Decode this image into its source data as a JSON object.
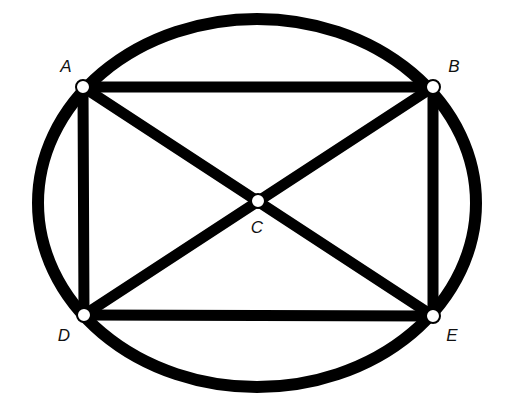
{
  "diagram": {
    "type": "geometry",
    "colors": {
      "stroke": "#000000",
      "node_fill": "#ffffff",
      "background": "#ffffff",
      "label": "#111111"
    },
    "ellipse": {
      "cx": 257,
      "cy": 203,
      "rx": 219,
      "ry": 184,
      "stroke_width": 12
    },
    "nodes": [
      {
        "id": "A",
        "label": "A",
        "x": 83,
        "y": 87,
        "label_x": 66,
        "label_y": 66
      },
      {
        "id": "B",
        "label": "B",
        "x": 433,
        "y": 87,
        "label_x": 454,
        "label_y": 66
      },
      {
        "id": "C",
        "label": "C",
        "x": 258,
        "y": 201,
        "label_x": 257,
        "label_y": 227
      },
      {
        "id": "D",
        "label": "D",
        "x": 84,
        "y": 315,
        "label_x": 64,
        "label_y": 335
      },
      {
        "id": "E",
        "label": "E",
        "x": 433,
        "y": 316,
        "label_x": 452,
        "label_y": 335
      }
    ],
    "edges": [
      {
        "from": "A",
        "to": "B"
      },
      {
        "from": "B",
        "to": "E"
      },
      {
        "from": "E",
        "to": "D"
      },
      {
        "from": "D",
        "to": "A"
      },
      {
        "from": "A",
        "to": "E"
      },
      {
        "from": "B",
        "to": "D"
      }
    ]
  }
}
